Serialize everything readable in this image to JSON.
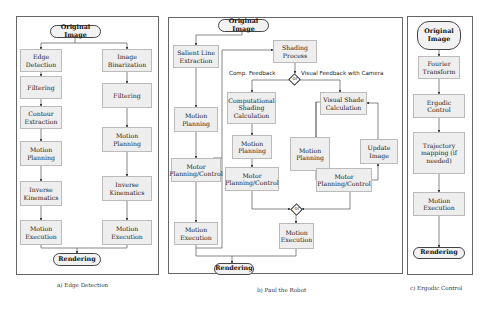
{
  "panel_a": {
    "caption": "a) Edge Detection",
    "start": "Original Image",
    "end": "Rendering",
    "left_branch": [
      "Edge Detection",
      "Filtering",
      "Contour Extraction",
      "Motion Planning",
      "Inverse Kinematics",
      "Motion Execution"
    ],
    "right_branch": [
      "Image Binarization",
      "Filtering",
      "Motion Planning",
      "Inverse Kinematics",
      "Motion Execution"
    ]
  },
  "panel_b": {
    "caption": "b) Paul the Robot",
    "start": "Original Image",
    "end": "Rendering",
    "left_branch": [
      "Salient Line Extraction",
      "Motion Planning",
      "Motor Planning/Control",
      "Motion Execution"
    ],
    "shading_process": "Shading Process",
    "decision_label": "or",
    "comp_feedback_label": "Comp. Feedback",
    "visual_feedback_label": "Visual Feedback with Camera",
    "comp_branch": [
      "Computational Shading Calculation",
      "Motion Planning",
      "Motor Planning/Control"
    ],
    "visual_branch": {
      "calc": "Visual Shade Calculation",
      "planning": "Motion Planning",
      "control": "Motor Planning/Control",
      "update": "Update Image"
    },
    "merge_label": "or",
    "execution": "Motion Execution"
  },
  "panel_c": {
    "caption": "c) Ergodic Control",
    "start": "Original Image",
    "end": "Rendering",
    "steps": [
      "Fourier Transform",
      "Ergodic Control",
      "Trajectory mapping (if needed)",
      "Motion Execution"
    ]
  }
}
